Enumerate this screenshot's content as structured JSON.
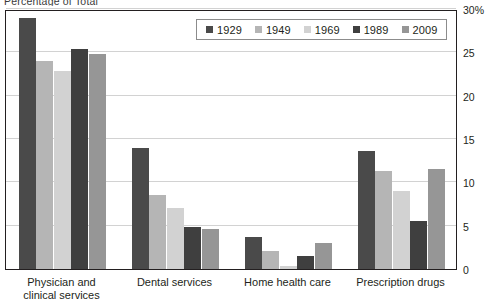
{
  "chart_data": {
    "type": "bar",
    "title": "Percentage of Total",
    "categories": [
      "Physician and\nclinical services",
      "Dental services",
      "Home health care",
      "Prescription drugs"
    ],
    "series": [
      {
        "name": "1929",
        "color": "#4a4a4a",
        "values": [
          29.0,
          14.0,
          3.7,
          13.6
        ]
      },
      {
        "name": "1949",
        "color": "#b5b5b5",
        "values": [
          24.0,
          8.5,
          2.1,
          11.3
        ]
      },
      {
        "name": "1969",
        "color": "#d2d2d2",
        "values": [
          22.8,
          7.0,
          0.3,
          9.0
        ]
      },
      {
        "name": "1989",
        "color": "#3f3f3f",
        "values": [
          25.4,
          4.8,
          1.5,
          5.5
        ]
      },
      {
        "name": "2009",
        "color": "#969696",
        "values": [
          24.8,
          4.6,
          3.0,
          11.5
        ]
      }
    ],
    "ylabel": "",
    "xlabel": "",
    "ylim": [
      0,
      30
    ],
    "yticks": [
      0,
      5,
      10,
      15,
      20,
      25,
      30
    ],
    "ytick_labels": [
      "0",
      "5",
      "10",
      "15",
      "20",
      "25",
      "30%"
    ],
    "grid": true,
    "legend_position": "top-center"
  }
}
